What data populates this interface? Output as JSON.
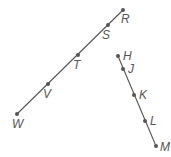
{
  "diagram": {
    "lines": [
      {
        "name": "line-RW",
        "points": [
          {
            "label": "R",
            "x": 123,
            "y": 10,
            "lx": 121,
            "ly": 23
          },
          {
            "label": "S",
            "x": 108,
            "y": 25,
            "lx": 102,
            "ly": 39
          },
          {
            "label": "T",
            "x": 78,
            "y": 55,
            "lx": 73,
            "ly": 69
          },
          {
            "label": "V",
            "x": 48,
            "y": 84,
            "lx": 43,
            "ly": 98
          },
          {
            "label": "W",
            "x": 17,
            "y": 114,
            "lx": 12,
            "ly": 128
          }
        ]
      },
      {
        "name": "line-HM",
        "points": [
          {
            "label": "H",
            "x": 118,
            "y": 56,
            "lx": 123,
            "ly": 60
          },
          {
            "label": "J",
            "x": 123,
            "y": 69,
            "lx": 128,
            "ly": 73
          },
          {
            "label": "K",
            "x": 134,
            "y": 95,
            "lx": 139,
            "ly": 99
          },
          {
            "label": "L",
            "x": 145,
            "y": 121,
            "lx": 150,
            "ly": 125
          },
          {
            "label": "M",
            "x": 156,
            "y": 146,
            "lx": 160,
            "ly": 151
          }
        ]
      }
    ],
    "color": "#555555"
  }
}
